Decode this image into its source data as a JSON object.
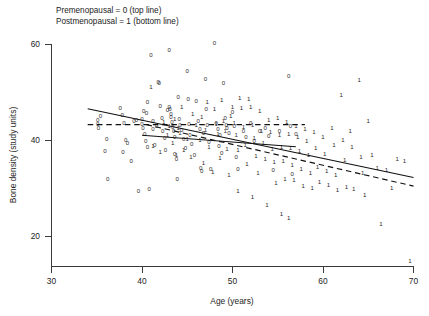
{
  "legend": {
    "line1": "Premenopausal = 0 (top line)",
    "line2": "Postmenopausal = 1 (bottom line)"
  },
  "axes": {
    "x_title": "Age (years)",
    "y_title": "Bone density (study units)",
    "x_ticks": [
      "30",
      "40",
      "50",
      "60",
      "70"
    ],
    "y_ticks": [
      "20",
      "40",
      "60"
    ]
  },
  "chart_data": {
    "type": "scatter",
    "title": "",
    "xlabel": "Age (years)",
    "ylabel": "Bone density (study units)",
    "xlim": [
      30,
      70
    ],
    "ylim": [
      14.2,
      62.5
    ],
    "xticks": [
      30,
      40,
      50,
      60,
      70
    ],
    "yticks": [
      20,
      40,
      60
    ],
    "grid": false,
    "legend_position": "above-plot-left",
    "legend_entries": [
      "Premenopausal = 0 (top line)",
      "Postmenopausal = 1 (bottom line)"
    ],
    "marker_encoding": {
      "0": "Premenopausal",
      "1": "Postmenopausal"
    },
    "series": [
      {
        "name": "Premenopausal",
        "marker": "0",
        "points": [
          [
            35.1,
            44.2
          ],
          [
            35.1,
            43.3
          ],
          [
            35.2,
            42.6
          ],
          [
            35.4,
            45.0
          ],
          [
            35.9,
            37.8
          ],
          [
            36.1,
            40.3
          ],
          [
            36.2,
            32.0
          ],
          [
            37.6,
            46.6
          ],
          [
            37.8,
            45.2
          ],
          [
            37.9,
            37.6
          ],
          [
            38.0,
            43.6
          ],
          [
            38.2,
            40.0
          ],
          [
            38.4,
            39.3
          ],
          [
            38.8,
            35.6
          ],
          [
            39.1,
            43.9
          ],
          [
            39.4,
            44.2
          ],
          [
            39.6,
            29.4
          ],
          [
            40.0,
            44.5
          ],
          [
            40.0,
            43.3
          ],
          [
            40.1,
            42.6
          ],
          [
            40.2,
            46.0
          ],
          [
            40.3,
            41.2
          ],
          [
            40.4,
            39.8
          ],
          [
            40.5,
            45.7
          ],
          [
            40.6,
            38.5
          ],
          [
            40.6,
            48.0
          ],
          [
            40.8,
            29.8
          ],
          [
            41.0,
            57.8
          ],
          [
            41.2,
            44.0
          ],
          [
            41.2,
            42.4
          ],
          [
            41.4,
            39.0
          ],
          [
            41.6,
            43.0
          ],
          [
            41.8,
            52.2
          ],
          [
            41.9,
            51.9
          ],
          [
            42.0,
            47.2
          ],
          [
            42.2,
            44.7
          ],
          [
            42.3,
            42.0
          ],
          [
            42.5,
            40.5
          ],
          [
            42.6,
            38.0
          ],
          [
            42.8,
            46.3
          ],
          [
            43.0,
            58.8
          ],
          [
            43.0,
            47.0
          ],
          [
            43.1,
            46.5
          ],
          [
            43.2,
            45.5
          ],
          [
            43.2,
            44.8
          ],
          [
            43.3,
            43.7
          ],
          [
            43.4,
            42.8
          ],
          [
            43.5,
            41.9
          ],
          [
            43.6,
            40.7
          ],
          [
            43.6,
            37.2
          ],
          [
            43.8,
            36.1
          ],
          [
            43.9,
            32.0
          ],
          [
            44.0,
            49.0
          ],
          [
            44.1,
            44.3
          ],
          [
            44.2,
            43.2
          ],
          [
            44.4,
            42.1
          ],
          [
            44.6,
            40.2
          ],
          [
            44.8,
            38.3
          ],
          [
            45.0,
            54.3
          ],
          [
            45.1,
            48.5
          ],
          [
            45.2,
            43.4
          ],
          [
            45.3,
            41.0
          ],
          [
            45.5,
            39.2
          ],
          [
            45.8,
            37.0
          ],
          [
            46.0,
            48.2
          ],
          [
            46.2,
            44.0
          ],
          [
            46.4,
            42.3
          ],
          [
            46.5,
            34.2
          ],
          [
            46.6,
            33.6
          ],
          [
            46.8,
            41.5
          ],
          [
            47.0,
            52.8
          ],
          [
            47.1,
            46.5
          ],
          [
            47.2,
            43.1
          ],
          [
            47.4,
            39.6
          ],
          [
            47.6,
            34.0
          ],
          [
            48.0,
            60.3
          ],
          [
            48.2,
            43.5
          ],
          [
            48.4,
            42.4
          ],
          [
            48.5,
            38.7
          ],
          [
            48.6,
            41.0
          ],
          [
            48.8,
            37.4
          ],
          [
            49.0,
            52.0
          ],
          [
            49.2,
            44.6
          ],
          [
            49.3,
            43.2
          ],
          [
            49.4,
            42.5
          ],
          [
            49.6,
            41.4
          ],
          [
            50.0,
            45.8
          ],
          [
            50.2,
            43.0
          ],
          [
            50.4,
            36.5
          ],
          [
            50.6,
            33.9
          ],
          [
            51.2,
            42.0
          ],
          [
            51.5,
            40.6
          ],
          [
            52.0,
            43.6
          ],
          [
            52.4,
            39.8
          ],
          [
            53.0,
            41.8
          ],
          [
            53.6,
            42.5
          ],
          [
            54.0,
            40.8
          ],
          [
            54.5,
            33.8
          ],
          [
            55.2,
            42.0
          ],
          [
            56.2,
            53.4
          ],
          [
            56.4,
            42.9
          ],
          [
            56.6,
            33.0
          ],
          [
            57.0,
            41.2
          ]
        ]
      },
      {
        "name": "Postmenopausal",
        "marker": "1",
        "points": [
          [
            41.0,
            51.0
          ],
          [
            41.2,
            38.8
          ],
          [
            42.0,
            37.6
          ],
          [
            42.8,
            41.0
          ],
          [
            43.0,
            43.0
          ],
          [
            43.4,
            39.5
          ],
          [
            43.8,
            36.8
          ],
          [
            44.0,
            42.6
          ],
          [
            44.2,
            41.4
          ],
          [
            44.6,
            38.0
          ],
          [
            45.0,
            40.2
          ],
          [
            45.4,
            36.4
          ],
          [
            46.0,
            43.2
          ],
          [
            46.4,
            40.0
          ],
          [
            46.8,
            35.2
          ],
          [
            47.0,
            42.2
          ],
          [
            47.4,
            38.6
          ],
          [
            47.8,
            33.4
          ],
          [
            48.0,
            46.5
          ],
          [
            48.2,
            43.4
          ],
          [
            48.4,
            41.2
          ],
          [
            48.6,
            36.2
          ],
          [
            49.0,
            44.0
          ],
          [
            49.2,
            42.0
          ],
          [
            49.4,
            38.2
          ],
          [
            49.6,
            32.8
          ],
          [
            50.0,
            46.8
          ],
          [
            50.2,
            43.6
          ],
          [
            50.4,
            41.0
          ],
          [
            50.6,
            38.0
          ],
          [
            51.0,
            46.6
          ],
          [
            51.2,
            42.8
          ],
          [
            51.4,
            39.0
          ],
          [
            51.6,
            35.0
          ],
          [
            52.0,
            47.0
          ],
          [
            52.2,
            43.2
          ],
          [
            52.4,
            40.4
          ],
          [
            52.6,
            36.6
          ],
          [
            52.8,
            33.2
          ],
          [
            53.0,
            46.0
          ],
          [
            53.2,
            42.0
          ],
          [
            53.4,
            39.4
          ],
          [
            53.6,
            36.0
          ],
          [
            54.0,
            44.2
          ],
          [
            54.2,
            41.6
          ],
          [
            54.4,
            38.2
          ],
          [
            54.6,
            35.4
          ],
          [
            54.8,
            31.0
          ],
          [
            55.0,
            44.6
          ],
          [
            55.2,
            41.0
          ],
          [
            55.4,
            38.6
          ],
          [
            55.6,
            35.6
          ],
          [
            55.8,
            32.0
          ],
          [
            56.0,
            43.8
          ],
          [
            56.2,
            41.2
          ],
          [
            56.4,
            38.4
          ],
          [
            56.6,
            34.8
          ],
          [
            56.8,
            31.6
          ],
          [
            57.0,
            43.0
          ],
          [
            57.2,
            40.6
          ],
          [
            57.4,
            37.8
          ],
          [
            57.6,
            34.0
          ],
          [
            57.8,
            30.4
          ],
          [
            58.0,
            42.4
          ],
          [
            58.2,
            39.8
          ],
          [
            58.4,
            36.8
          ],
          [
            58.6,
            33.2
          ],
          [
            58.8,
            30.0
          ],
          [
            59.0,
            41.6
          ],
          [
            59.2,
            38.4
          ],
          [
            59.4,
            34.4
          ],
          [
            59.6,
            31.2
          ],
          [
            60.0,
            40.6
          ],
          [
            60.2,
            37.2
          ],
          [
            60.4,
            33.6
          ],
          [
            60.6,
            30.6
          ],
          [
            61.0,
            42.6
          ],
          [
            61.2,
            39.0
          ],
          [
            61.4,
            32.8
          ],
          [
            61.6,
            29.6
          ],
          [
            62.0,
            49.4
          ],
          [
            62.2,
            40.0
          ],
          [
            62.4,
            35.8
          ],
          [
            62.6,
            30.2
          ],
          [
            63.0,
            41.8
          ],
          [
            63.2,
            38.6
          ],
          [
            63.4,
            29.8
          ],
          [
            64.0,
            52.6
          ],
          [
            64.2,
            36.4
          ],
          [
            64.4,
            33.2
          ],
          [
            64.6,
            28.6
          ],
          [
            65.0,
            44.0
          ],
          [
            65.4,
            37.0
          ],
          [
            66.0,
            34.2
          ],
          [
            66.4,
            22.6
          ],
          [
            67.0,
            33.8
          ],
          [
            67.6,
            30.0
          ],
          [
            68.2,
            36.0
          ],
          [
            69.0,
            35.6
          ],
          [
            69.6,
            14.8
          ],
          [
            50.8,
            48.8
          ],
          [
            51.8,
            48.6
          ],
          [
            48.8,
            48.4
          ],
          [
            47.2,
            48.0
          ],
          [
            44.4,
            46.8
          ],
          [
            45.6,
            45.4
          ],
          [
            46.6,
            44.8
          ],
          [
            49.8,
            45.0
          ],
          [
            43.6,
            44.4
          ],
          [
            42.4,
            43.8
          ],
          [
            53.8,
            26.4
          ],
          [
            55.4,
            24.6
          ],
          [
            56.2,
            23.8
          ],
          [
            52.2,
            28.2
          ],
          [
            50.6,
            29.4
          ]
        ]
      }
    ],
    "fit_lines": [
      {
        "name": "premenopausal-fit",
        "style": "solid",
        "description": "top line — full-range solid regression line",
        "x_start": 34.0,
        "y_start": 46.5,
        "x_end": 70.0,
        "y_end": 32.2
      },
      {
        "name": "postmenopausal-fit",
        "style": "dashed",
        "description": "bottom line — dashed regression line, flat then declining",
        "segments": [
          {
            "x_start": 34.0,
            "y_start": 43.2,
            "x_end": 58.0,
            "y_end": 43.2
          },
          {
            "x_start": 40.5,
            "y_start": 43.2,
            "x_end": 70.0,
            "y_end": 30.4
          }
        ]
      },
      {
        "name": "lower-solid-segment",
        "style": "solid",
        "description": "secondary solid regression segment below main line",
        "x_start": 40.0,
        "y_start": 41.0,
        "x_end": 57.0,
        "y_end": 38.6
      }
    ]
  }
}
